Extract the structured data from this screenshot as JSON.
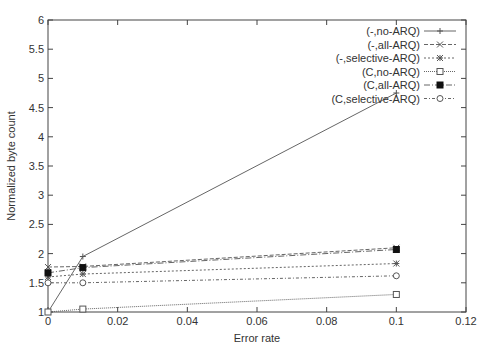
{
  "chart_data": {
    "type": "line",
    "title": "",
    "xlabel": "Error rate",
    "ylabel": "Normalized byte count",
    "xlim": [
      0,
      0.12
    ],
    "ylim": [
      1,
      6
    ],
    "xticks": [
      "0",
      "0.02",
      "0.04",
      "0.06",
      "0.08",
      "0.1",
      "0.12"
    ],
    "yticks": [
      "1",
      "1.5",
      "2",
      "2.5",
      "3",
      "3.5",
      "4",
      "4.5",
      "5",
      "5.5",
      "6"
    ],
    "grid": false,
    "legend_position": "top-right",
    "x": [
      0,
      0.01,
      0.1
    ],
    "series": [
      {
        "name": "(-,no-ARQ)",
        "values": [
          1.0,
          1.95,
          4.75
        ],
        "marker": "plus",
        "dash": ""
      },
      {
        "name": "(-,all-ARQ)",
        "values": [
          1.77,
          1.78,
          2.1
        ],
        "marker": "cross",
        "dash": "4,2"
      },
      {
        "name": "(-,selective-ARQ)",
        "values": [
          1.6,
          1.65,
          1.83
        ],
        "marker": "star",
        "dash": "2,2"
      },
      {
        "name": "(C,no-ARQ)",
        "values": [
          1.0,
          1.05,
          1.3
        ],
        "marker": "square-open",
        "dash": "1,1"
      },
      {
        "name": "(C,all-ARQ)",
        "values": [
          1.67,
          1.76,
          2.07
        ],
        "marker": "square-filled",
        "dash": "6,2,1,2"
      },
      {
        "name": "(C,selective-ARQ)",
        "values": [
          1.5,
          1.5,
          1.62
        ],
        "marker": "circle-open",
        "dash": "3,2,1,2"
      }
    ]
  }
}
